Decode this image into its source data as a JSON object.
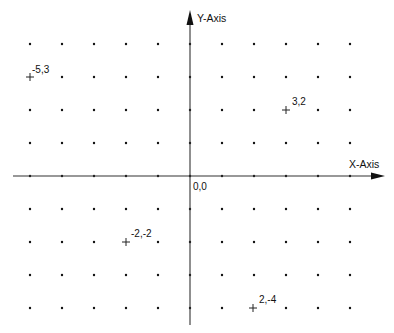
{
  "diagram": {
    "type": "coordinate-grid",
    "x_axis_label": "X-Axis",
    "y_axis_label": "Y-Axis",
    "origin_label": "0,0",
    "x_range": [
      -5,
      5
    ],
    "y_range": [
      -4,
      4
    ],
    "grid_step": 1,
    "colors": {
      "axis": "#333333",
      "dot": "#111111",
      "marker": "#222222",
      "text": "#111111",
      "background": "#ffffff"
    },
    "points": [
      {
        "x": -5,
        "y": 3,
        "label": "-5,3"
      },
      {
        "x": 3,
        "y": 2,
        "label": "3,2"
      },
      {
        "x": -2,
        "y": -2,
        "label": "-2,-2"
      },
      {
        "x": 2,
        "y": -4,
        "label": "2,-4"
      }
    ]
  }
}
